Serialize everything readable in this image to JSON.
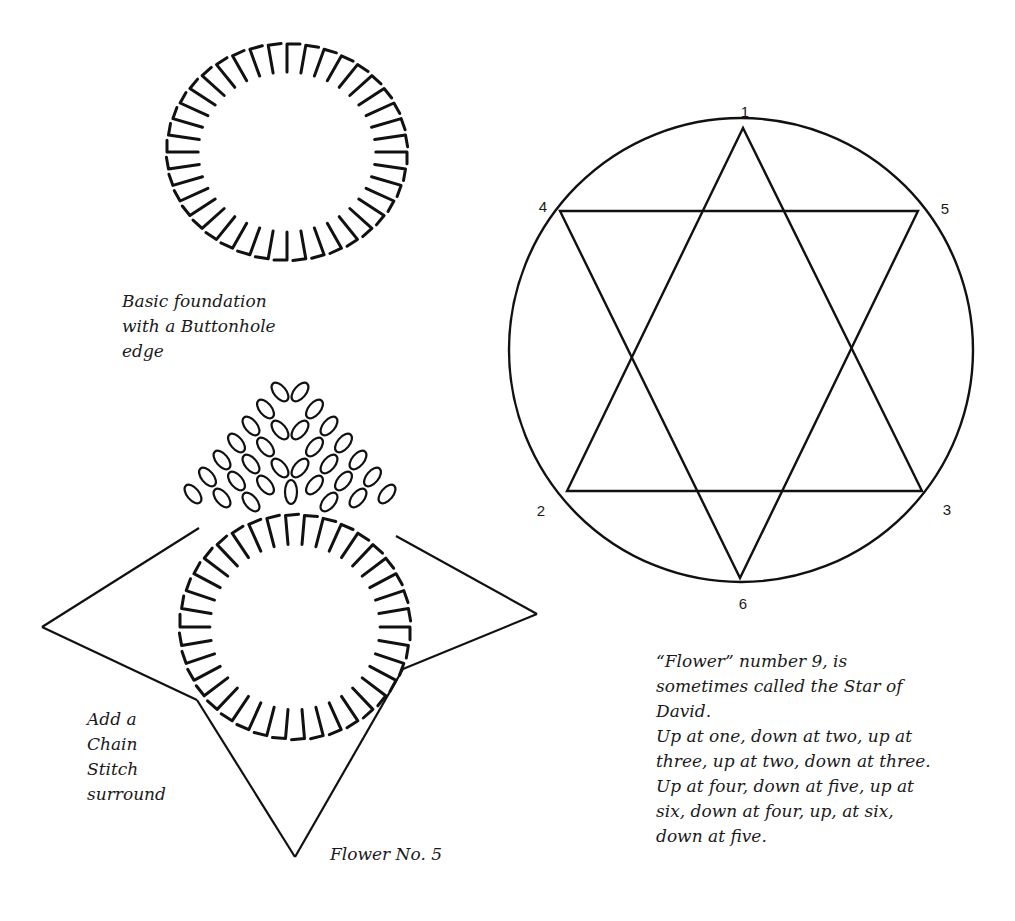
{
  "figure1": {
    "caption_lines": [
      "Basic foundation",
      "with a Buttonhole",
      "edge"
    ],
    "ring": {
      "cx": 287,
      "cy": 152,
      "rx": 120,
      "ry": 108,
      "stitch_count": 40
    }
  },
  "figure2": {
    "caption_lines": [
      "Add a",
      "Chain",
      "Stitch",
      "surround"
    ],
    "title": "Flower No. 5",
    "ring": {
      "cx": 295,
      "cy": 627,
      "rx": 115,
      "ry": 112,
      "stitch_count": 38
    },
    "star_points": [
      [
        290,
        380
      ],
      [
        537,
        614
      ],
      [
        295,
        857
      ],
      [
        42,
        627
      ]
    ],
    "star_notches": [
      [
        199,
        528
      ],
      [
        396,
        536
      ],
      [
        403,
        669
      ],
      [
        197,
        700
      ]
    ]
  },
  "figure3": {
    "circle": {
      "cx": 741,
      "cy": 350,
      "r": 232
    },
    "vertices": [
      {
        "label": "1",
        "x": 743,
        "y": 128,
        "lx": 745,
        "ly": 111
      },
      {
        "label": "2",
        "x": 567,
        "y": 491,
        "lx": 541,
        "ly": 510
      },
      {
        "label": "3",
        "x": 922,
        "y": 491,
        "lx": 947,
        "ly": 509
      },
      {
        "label": "4",
        "x": 560,
        "y": 211,
        "lx": 543,
        "ly": 206
      },
      {
        "label": "5",
        "x": 918,
        "y": 211,
        "lx": 945,
        "ly": 208
      },
      {
        "label": "6",
        "x": 740,
        "y": 578,
        "lx": 743,
        "ly": 603
      }
    ],
    "triangles": [
      [
        "1",
        "2",
        "3"
      ],
      [
        "4",
        "5",
        "6"
      ]
    ],
    "caption_lines": [
      "“Flower” number 9, is",
      "sometimes called the Star of",
      "David.",
      "Up at one, down at two, up at",
      "three, up at two, down at three.",
      "Up at four, down at five, up at",
      "six, down at four, up, at six,",
      "down at five."
    ]
  },
  "colors": {
    "ink": "#111111",
    "background": "#ffffff"
  }
}
